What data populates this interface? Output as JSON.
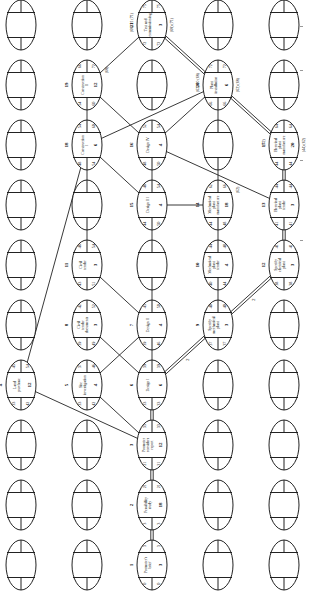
{
  "diagram": {
    "grid": {
      "cols_x": [
        21,
        87,
        152,
        218,
        284
      ],
      "rows_y": [
        25,
        85,
        145,
        205,
        265,
        325,
        385,
        445,
        505,
        565
      ],
      "oval_rx": 15,
      "oval_ry": 25
    },
    "nodes": [
      {
        "id": 1,
        "col": 2,
        "row": 9,
        "label": "Promoter's brief",
        "duration": "3",
        "es": "0",
        "ls": "0",
        "ef": "3",
        "lf": "3",
        "critical": true
      },
      {
        "id": 2,
        "col": 2,
        "row": 8,
        "label": "Feasibility study",
        "duration": "18",
        "es": "3",
        "ls": "3",
        "ef": "21",
        "lf": "21",
        "critical": true
      },
      {
        "id": 3,
        "col": 2,
        "row": 7,
        "label": "Promoter considers report",
        "duration": "12",
        "es": "21",
        "ls": "21",
        "ef": "33",
        "lf": "33",
        "critical": true
      },
      {
        "id": 4,
        "col": 0,
        "row": 5,
        "label": "Land purchase",
        "duration": "12",
        "es": "33",
        "ls": "42",
        "ef": "45",
        "lf": "54",
        "critical": false
      },
      {
        "id": 5,
        "col": 1,
        "row": 5,
        "label": "Site investigation",
        "duration": "4",
        "es": "33",
        "ls": "42",
        "ef": "37",
        "lf": "46",
        "critical": false
      },
      {
        "id": 6,
        "col": 2,
        "row": 5,
        "label": "Design I",
        "duration": "6",
        "es": "33",
        "ls": "33",
        "ef": "39",
        "lf": "39",
        "critical": true
      },
      {
        "id": 7,
        "col": 2,
        "row": 4,
        "label": "Design II",
        "duration": "4",
        "es": "39",
        "ls": "46",
        "ef": "43",
        "lf": "50",
        "critical": false
      },
      {
        "id": 8,
        "col": 1,
        "row": 4,
        "label": "Civil tender documents",
        "duration": "3",
        "es": "39",
        "ls": "49",
        "ef": "42",
        "lf": "52",
        "critical": false
      },
      {
        "id": 9,
        "col": 3,
        "row": 4,
        "label": "Specify mechanical plant",
        "duration": "3",
        "es": "37",
        "ls": "37",
        "ef": "40",
        "lf": "40",
        "critical": true
      },
      {
        "id": 10,
        "col": 3,
        "row": 3,
        "label": "Mechanical plant tender",
        "duration": "4",
        "es": "40",
        "ls": "44",
        "ef": "44",
        "lf": "48",
        "critical": false
      },
      {
        "id": 11,
        "col": 1,
        "row": 3,
        "label": "Civil tender",
        "duration": "3",
        "es": "43",
        "ls": "51",
        "ef": "46",
        "lf": "54",
        "critical": false
      },
      {
        "id": 12,
        "col": 4,
        "row": 3,
        "label": "Specify electrical plant",
        "duration": "3",
        "es": "38",
        "ls": "38",
        "ef": "41",
        "lf": "41",
        "critical": true
      },
      {
        "id": 13,
        "col": 4,
        "row": 2,
        "label": "Electrical plant tender",
        "duration": "3",
        "es": "41",
        "ls": "41",
        "ef": "44",
        "lf": "44",
        "critical": true
      },
      {
        "id": 14,
        "col": 3,
        "row": 2,
        "label": "Mechanical plant manufacture",
        "duration": "18",
        "es": "44",
        "ls": "48",
        "ef": "62",
        "lf": "66",
        "critical": false,
        "note": "(62)"
      },
      {
        "id": 15,
        "col": 2,
        "row": 2,
        "label": "Design III",
        "duration": "4",
        "es": "44",
        "ls": "50",
        "ef": "48",
        "lf": "54",
        "critical": false
      },
      {
        "id": 16,
        "col": 2,
        "row": 1,
        "label": "Design IV",
        "duration": "4",
        "es": "48",
        "ls": "50",
        "ef": "52",
        "lf": "54",
        "critical": false
      },
      {
        "id": 17,
        "col": 4,
        "row": 1,
        "label": "Electrical plant manufacture",
        "duration": "20",
        "es": "44",
        "ls": "44",
        "ef": "64",
        "lf": "64",
        "critical": true,
        "note_top": "(62)",
        "note_bottom": "(44) (62)"
      },
      {
        "id": 18,
        "col": 1,
        "row": 1,
        "label": "Construction I",
        "duration": "6",
        "es": "48",
        "ls": "54",
        "ef": "54",
        "lf": "60",
        "critical": false
      },
      {
        "id": 19,
        "col": 1,
        "row": 0,
        "label": "Construction II",
        "duration": "12",
        "es": "54",
        "ls": "60",
        "ef": "66",
        "lf": "72",
        "critical": false,
        "note": "(68)"
      },
      {
        "id": 20,
        "col": 3,
        "row": 0,
        "label": "Plant installation",
        "duration": "6",
        "es": "66",
        "ls": "66",
        "ef": "72",
        "lf": "72",
        "critical": true,
        "note_top": "(62) 20 (68)",
        "note_bottom": "(62) (68)"
      },
      {
        "id": 21,
        "col": 2,
        "row": -1,
        "label": "Test and commissioning",
        "duration": "3",
        "es": "72",
        "ls": "72",
        "ef": "75",
        "lf": "75",
        "critical": true,
        "note_top": "(68) 21 (71)",
        "note_bottom": "(68) (71)"
      }
    ],
    "edges": [
      {
        "from": 1,
        "to": 2,
        "critical": true
      },
      {
        "from": 2,
        "to": 3,
        "critical": true
      },
      {
        "from": 3,
        "to": 4,
        "critical": false
      },
      {
        "from": 3,
        "to": 5,
        "critical": false
      },
      {
        "from": 3,
        "to": 6,
        "critical": true
      },
      {
        "from": 6,
        "to": 7,
        "critical": false
      },
      {
        "from": 6,
        "to": 9,
        "critical": true,
        "label": "2"
      },
      {
        "from": 5,
        "to": 7,
        "critical": false
      },
      {
        "from": 6,
        "to": 8,
        "critical": false
      },
      {
        "from": 9,
        "to": 10,
        "critical": false
      },
      {
        "from": 9,
        "to": 12,
        "critical": true,
        "label": "2"
      },
      {
        "from": 7,
        "to": 11,
        "critical": false
      },
      {
        "from": 7,
        "to": 15,
        "critical": false
      },
      {
        "from": 10,
        "to": 14,
        "critical": false
      },
      {
        "from": 12,
        "to": 13,
        "critical": true
      },
      {
        "from": 13,
        "to": 17,
        "critical": true
      },
      {
        "from": 15,
        "to": 16,
        "critical": false
      },
      {
        "from": 15,
        "to": 14,
        "critical": false
      },
      {
        "from": 16,
        "to": 13,
        "critical": false
      },
      {
        "from": 16,
        "to": 19,
        "critical": false
      },
      {
        "from": 16,
        "to": 20,
        "critical": false
      },
      {
        "from": 4,
        "to": 18,
        "critical": false
      },
      {
        "from": 11,
        "to": 18,
        "critical": false
      },
      {
        "from": 18,
        "to": 15,
        "critical": false
      },
      {
        "from": 18,
        "to": 19,
        "critical": false
      },
      {
        "from": 18,
        "to": 20,
        "critical": false
      },
      {
        "from": 14,
        "to": 20,
        "critical": false
      },
      {
        "from": 17,
        "to": 20,
        "critical": true
      },
      {
        "from": 19,
        "to": 21,
        "critical": false
      },
      {
        "from": 20,
        "to": 21,
        "critical": true
      }
    ]
  }
}
